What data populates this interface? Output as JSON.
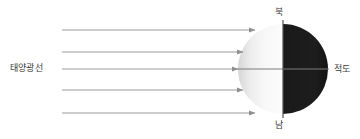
{
  "diagram": {
    "title_visible": false,
    "type": "sunlight-earth-illumination-diagram",
    "background_color": "#ffffff",
    "labels": {
      "sun_rays": "태양광선",
      "north": "북",
      "south": "남",
      "equator": "적도"
    },
    "colors": {
      "ray_stroke": "#9a9a9a",
      "arrow_head": "#8f8f8f",
      "lit_side_light": "#fbfbfb",
      "lit_side_dark": "#d4d4d4",
      "dark_side": "#1c1c1c",
      "equator_line": "#7d7d7d",
      "axis_line": "#5a5a5a",
      "text": "#3a3a3a"
    },
    "sphere": {
      "center_x": 283,
      "center_y": 69,
      "radius": 45,
      "terminator_x": 283,
      "equator_y": 69
    },
    "rays": [
      {
        "id": "ray-1",
        "y": 30,
        "x_start": 62,
        "x_end": 255
      },
      {
        "id": "ray-2",
        "y": 52,
        "x_start": 62,
        "x_end": 243
      },
      {
        "id": "ray-3",
        "y": 69,
        "x_start": 62,
        "x_end": 238
      },
      {
        "id": "ray-4",
        "y": 90,
        "x_start": 62,
        "x_end": 243
      },
      {
        "id": "ray-5",
        "y": 113,
        "x_start": 62,
        "x_end": 255
      }
    ]
  }
}
